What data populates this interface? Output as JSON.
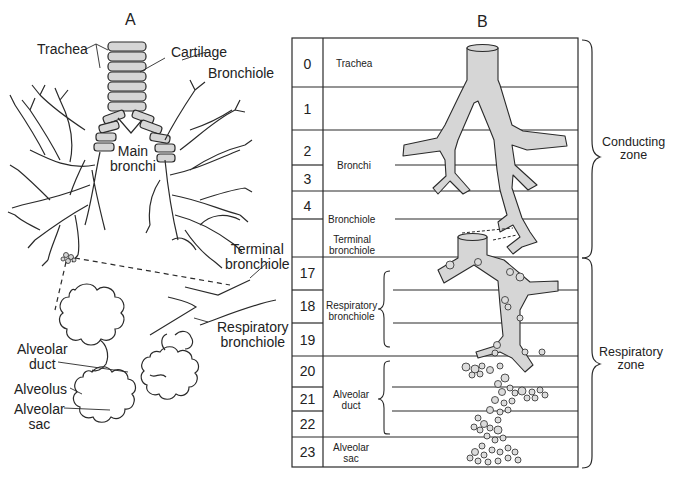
{
  "panels": {
    "a": {
      "label": "A",
      "labels": {
        "trachea": "Trachea",
        "cartilage": "Cartilage",
        "bronchiole": "Bronchiole",
        "main_bronchi_1": "Main",
        "main_bronchi_2": "bronchi",
        "terminal_bronchiole_1": "Terminal",
        "terminal_bronchiole_2": "bronchiole",
        "respiratory_bronchiole_1": "Respiratory",
        "respiratory_bronchiole_2": "bronchiole",
        "alveolar_duct_1": "Alveolar",
        "alveolar_duct_2": "duct",
        "alveolus": "Alveolus",
        "alveolar_sac_1": "Alveolar",
        "alveolar_sac_2": "sac"
      }
    },
    "b": {
      "label": "B",
      "generations": [
        {
          "num": "0"
        },
        {
          "num": "1"
        },
        {
          "num": "2"
        },
        {
          "num": "3"
        },
        {
          "num": "4"
        },
        {
          "num": ""
        },
        {
          "num": "17"
        },
        {
          "num": "18"
        },
        {
          "num": "19"
        },
        {
          "num": "20"
        },
        {
          "num": "21"
        },
        {
          "num": "22"
        },
        {
          "num": "23"
        }
      ],
      "segment_labels": {
        "trachea": "Trachea",
        "bronchi": "Bronchi",
        "bronchiole": "Bronchiole",
        "terminal_bronchiole_1": "Terminal",
        "terminal_bronchiole_2": "bronchiole",
        "respiratory_bronchiole_1": "Respiratory",
        "respiratory_bronchiole_2": "bronchiole",
        "alveolar_duct_1": "Alveolar",
        "alveolar_duct_2": "duct",
        "alveolar_sac_1": "Alveolar",
        "alveolar_sac_2": "sac"
      },
      "zones": {
        "conducting_1": "Conducting",
        "conducting_2": "zone",
        "respiratory_1": "Respiratory",
        "respiratory_2": "zone"
      }
    }
  },
  "colors": {
    "line": "#2a2a2a",
    "fill": "#d6d6d6",
    "background": "#ffffff"
  }
}
